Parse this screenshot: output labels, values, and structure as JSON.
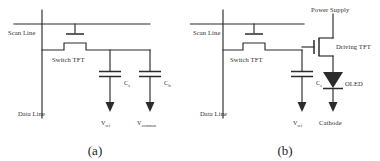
{
  "figure": {
    "type": "circuit-schematic",
    "background_color": "#ffffff",
    "line_color": "#2b2b2b",
    "text_color": "#2f2f2f",
    "panel_count": 2
  },
  "panels": [
    {
      "id": "a",
      "caption": "(a)",
      "title": "AMLCD pixel circuit",
      "labels": {
        "scan_line": "Scan Line",
        "data_line": "Data Line",
        "switch_tft": "Switch TFT",
        "cap_storage_symbol": "C",
        "cap_storage_sub": "s",
        "cap_lc_symbol": "C",
        "cap_lc_sub": "lc",
        "node_ref_symbol": "V",
        "node_ref_sub": "ref",
        "node_common_symbol": "V",
        "node_common_sub": "common"
      }
    },
    {
      "id": "b",
      "caption": "(b)",
      "title": "AMOLED pixel circuit",
      "labels": {
        "scan_line": "Scan Line",
        "data_line": "Data Line",
        "switch_tft": "Switch TFT",
        "driving_tft": "Driving TFT",
        "power_supply": "Power Supply",
        "oled": "OLED",
        "cathode": "Cathode",
        "cap_storage_symbol": "C",
        "cap_storage_sub": "s",
        "node_ref_symbol": "V",
        "node_ref_sub": "ref"
      }
    }
  ]
}
